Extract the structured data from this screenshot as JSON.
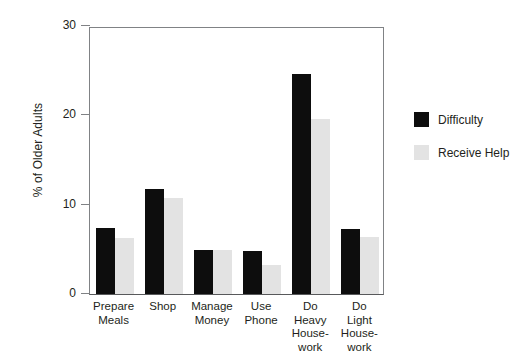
{
  "chart_data": {
    "type": "bar",
    "title": "",
    "xlabel": "",
    "ylabel": "% of Older Adults",
    "ylim": [
      0,
      30
    ],
    "yticks": [
      0,
      10,
      20,
      30
    ],
    "ytick_labels": [
      "0",
      "10",
      "20",
      "30"
    ],
    "grid": false,
    "legend_position": "right",
    "categories": [
      "Prepare Meals",
      "Shop",
      "Manage Money",
      "Use Phone",
      "Do Heavy House-work",
      "Do Light House-work"
    ],
    "category_lines": [
      [
        "Prepare",
        "Meals"
      ],
      [
        "Shop"
      ],
      [
        "Manage",
        "Money"
      ],
      [
        "Use",
        "Phone"
      ],
      [
        "Do",
        "Heavy",
        "House-",
        "work"
      ],
      [
        "Do",
        "Light",
        "House-",
        "work"
      ]
    ],
    "series": [
      {
        "name": "Difficulty",
        "color": "#0d0d0d",
        "values": [
          7.4,
          11.7,
          4.9,
          4.8,
          24.6,
          7.3
        ]
      },
      {
        "name": "Receive Help",
        "color": "#e3e3e3",
        "values": [
          6.3,
          10.8,
          4.9,
          3.3,
          19.6,
          6.4
        ]
      }
    ]
  },
  "legend": {
    "items": [
      {
        "label": "Difficulty",
        "color": "#0d0d0d"
      },
      {
        "label": "Receive Help",
        "color": "#e3e3e3"
      }
    ]
  },
  "colors": {
    "axis": "#808285",
    "text": "#231f20",
    "background": "#ffffff"
  }
}
